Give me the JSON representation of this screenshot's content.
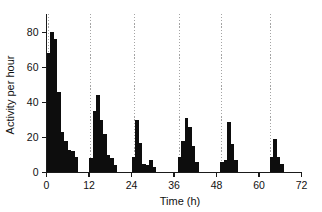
{
  "chart_data": {
    "type": "bar",
    "title": "",
    "subtitle": "",
    "xlabel": "Time (h)",
    "ylabel": "Activity per hour",
    "xlim": [
      0,
      72
    ],
    "ylim": [
      0,
      88
    ],
    "xticks": [
      0,
      12,
      24,
      36,
      48,
      60,
      72
    ],
    "xtick_labels": [
      "0",
      "12",
      "24",
      "36",
      "48",
      "60",
      "72"
    ],
    "yticks": [
      0,
      20,
      40,
      60,
      80
    ],
    "ytick_labels": [
      "0",
      "20",
      "40",
      "60",
      "80"
    ],
    "grid": "vertical dotted gridlines at onset of each activity burst",
    "gridlines_x": [
      0.6,
      12.4,
      24.8,
      37.6,
      49.4,
      63.2
    ],
    "legend": "none",
    "bar_width_hours": 1,
    "annotations": [],
    "x": [
      0,
      1,
      2,
      3,
      4,
      5,
      6,
      7,
      8,
      12,
      13,
      14,
      15,
      16,
      17,
      18,
      19,
      24,
      25,
      26,
      27,
      28,
      29,
      30,
      37,
      38,
      39,
      40,
      41,
      42,
      49,
      50,
      51,
      52,
      53,
      63,
      64,
      65,
      66
    ],
    "values": [
      68,
      80,
      76,
      46,
      23,
      18,
      13,
      12,
      9,
      8,
      35,
      44,
      30,
      22,
      10,
      8,
      4,
      9,
      30,
      17,
      5,
      4,
      7,
      3,
      9,
      18,
      31,
      26,
      15,
      6,
      6,
      7,
      29,
      16,
      7,
      9,
      19,
      9,
      5
    ],
    "series": [
      {
        "name": "Activity per hour",
        "bursts": [
          {
            "burst_index": 1,
            "onset_hour": 0,
            "bars": [
              {
                "hour": 0,
                "value": 68
              },
              {
                "hour": 1,
                "value": 80
              },
              {
                "hour": 2,
                "value": 76
              },
              {
                "hour": 3,
                "value": 46
              },
              {
                "hour": 4,
                "value": 23
              },
              {
                "hour": 5,
                "value": 18
              },
              {
                "hour": 6,
                "value": 13
              },
              {
                "hour": 7,
                "value": 12
              },
              {
                "hour": 8,
                "value": 9
              }
            ]
          },
          {
            "burst_index": 2,
            "onset_hour": 12,
            "bars": [
              {
                "hour": 12,
                "value": 8
              },
              {
                "hour": 13,
                "value": 35
              },
              {
                "hour": 14,
                "value": 44
              },
              {
                "hour": 15,
                "value": 30
              },
              {
                "hour": 16,
                "value": 22
              },
              {
                "hour": 17,
                "value": 10
              },
              {
                "hour": 18,
                "value": 8
              },
              {
                "hour": 19,
                "value": 4
              }
            ]
          },
          {
            "burst_index": 3,
            "onset_hour": 24,
            "bars": [
              {
                "hour": 24,
                "value": 9
              },
              {
                "hour": 25,
                "value": 30
              },
              {
                "hour": 26,
                "value": 17
              },
              {
                "hour": 27,
                "value": 5
              },
              {
                "hour": 28,
                "value": 4
              },
              {
                "hour": 29,
                "value": 7
              },
              {
                "hour": 30,
                "value": 3
              }
            ]
          },
          {
            "burst_index": 4,
            "onset_hour": 37,
            "bars": [
              {
                "hour": 37,
                "value": 9
              },
              {
                "hour": 38,
                "value": 18
              },
              {
                "hour": 39,
                "value": 31
              },
              {
                "hour": 40,
                "value": 26
              },
              {
                "hour": 41,
                "value": 15
              },
              {
                "hour": 42,
                "value": 6
              }
            ]
          },
          {
            "burst_index": 5,
            "onset_hour": 49,
            "bars": [
              {
                "hour": 49,
                "value": 6
              },
              {
                "hour": 50,
                "value": 7
              },
              {
                "hour": 51,
                "value": 29
              },
              {
                "hour": 52,
                "value": 16
              },
              {
                "hour": 53,
                "value": 7
              }
            ]
          },
          {
            "burst_index": 6,
            "onset_hour": 63,
            "bars": [
              {
                "hour": 63,
                "value": 9
              },
              {
                "hour": 64,
                "value": 19
              },
              {
                "hour": 65,
                "value": 9
              },
              {
                "hour": 66,
                "value": 5
              }
            ]
          }
        ]
      }
    ],
    "colors": {
      "bar": "#0d0d0d",
      "axis": "#1a1a1a",
      "gridline": "#9a9a9a",
      "background": "#ffffff",
      "text": "#111111"
    }
  }
}
